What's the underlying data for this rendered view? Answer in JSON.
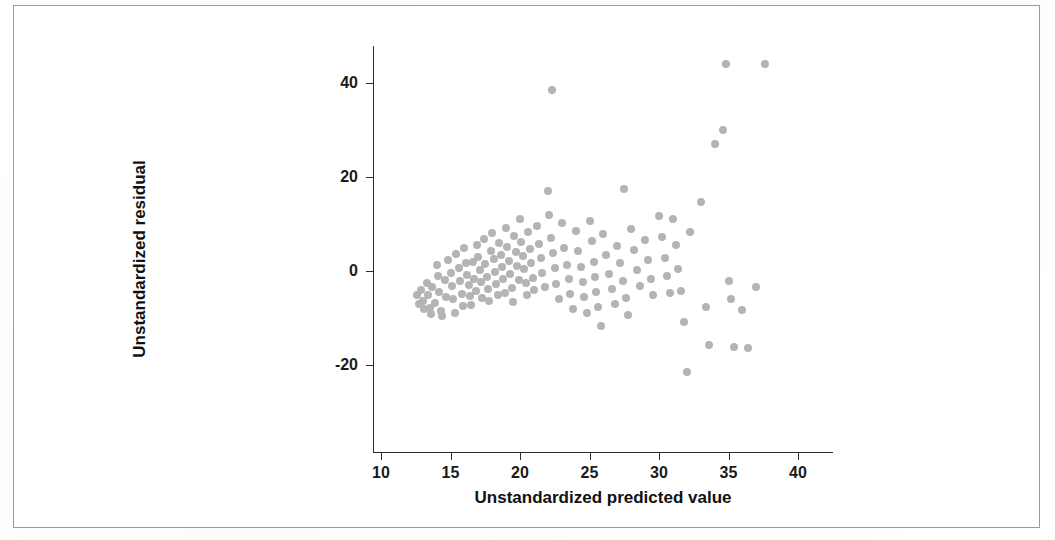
{
  "figure": {
    "background_color": "#ffffff",
    "border_color": "#9a9a9a",
    "axis_color": "#2b2b2b",
    "marker_color": "#b4b4b4"
  },
  "chart_data": {
    "type": "scatter",
    "title": "",
    "xlabel": "Unstandardized predicted value",
    "ylabel": "Unstandardized residual",
    "xlim": [
      8.5,
      41.5
    ],
    "ylim": [
      -28,
      48
    ],
    "xticks": [
      10,
      15,
      20,
      25,
      30,
      35,
      40
    ],
    "xticklabels": [
      "10",
      "15",
      "20",
      "25",
      "30",
      "35",
      "40"
    ],
    "yticks": [
      40,
      20,
      0,
      -20
    ],
    "yticklabels": [
      "40",
      "20",
      "0",
      "-20"
    ],
    "grid": false,
    "legend": false,
    "marker": "circle",
    "marker_color": "#b4b4b4",
    "points": [
      [
        12.6,
        -5.2
      ],
      [
        12.7,
        -7.0
      ],
      [
        12.9,
        -4.0
      ],
      [
        13.0,
        -6.3
      ],
      [
        13.1,
        -8.0
      ],
      [
        13.3,
        -2.6
      ],
      [
        13.4,
        -5.0
      ],
      [
        13.5,
        -7.8
      ],
      [
        13.6,
        -9.2
      ],
      [
        13.7,
        -3.4
      ],
      [
        13.9,
        -6.8
      ],
      [
        14.0,
        1.2
      ],
      [
        14.1,
        -1.0
      ],
      [
        14.2,
        -4.5
      ],
      [
        14.3,
        -8.6
      ],
      [
        14.4,
        -9.6
      ],
      [
        14.6,
        -2.0
      ],
      [
        14.7,
        -5.6
      ],
      [
        14.8,
        2.4
      ],
      [
        15.0,
        -0.4
      ],
      [
        15.1,
        -3.2
      ],
      [
        15.2,
        -6.0
      ],
      [
        15.3,
        -9.0
      ],
      [
        15.4,
        3.6
      ],
      [
        15.6,
        0.6
      ],
      [
        15.7,
        -2.2
      ],
      [
        15.8,
        -4.8
      ],
      [
        15.9,
        -7.4
      ],
      [
        16.0,
        4.8
      ],
      [
        16.1,
        1.8
      ],
      [
        16.2,
        -0.8
      ],
      [
        16.3,
        -3.0
      ],
      [
        16.4,
        -5.4
      ],
      [
        16.5,
        -7.2
      ],
      [
        16.6,
        2.0
      ],
      [
        16.7,
        -1.6
      ],
      [
        16.8,
        -4.2
      ],
      [
        16.9,
        5.6
      ],
      [
        17.0,
        3.0
      ],
      [
        17.1,
        0.2
      ],
      [
        17.2,
        -2.4
      ],
      [
        17.3,
        -5.8
      ],
      [
        17.4,
        6.8
      ],
      [
        17.5,
        1.4
      ],
      [
        17.6,
        -1.2
      ],
      [
        17.7,
        -3.8
      ],
      [
        17.8,
        -6.4
      ],
      [
        17.9,
        4.2
      ],
      [
        18.0,
        8.0
      ],
      [
        18.1,
        2.6
      ],
      [
        18.2,
        -0.2
      ],
      [
        18.3,
        -2.8
      ],
      [
        18.4,
        -5.0
      ],
      [
        18.5,
        6.0
      ],
      [
        18.6,
        3.4
      ],
      [
        18.7,
        0.8
      ],
      [
        18.8,
        -1.8
      ],
      [
        18.9,
        -4.6
      ],
      [
        19.0,
        9.2
      ],
      [
        19.1,
        5.2
      ],
      [
        19.2,
        2.2
      ],
      [
        19.3,
        -0.6
      ],
      [
        19.4,
        -3.6
      ],
      [
        19.5,
        -6.6
      ],
      [
        19.6,
        7.4
      ],
      [
        19.7,
        4.0
      ],
      [
        19.8,
        1.0
      ],
      [
        19.9,
        -2.0
      ],
      [
        20.0,
        11.0
      ],
      [
        20.1,
        6.2
      ],
      [
        20.2,
        3.2
      ],
      [
        20.3,
        0.4
      ],
      [
        20.4,
        -2.6
      ],
      [
        20.5,
        -5.2
      ],
      [
        20.6,
        8.4
      ],
      [
        20.7,
        4.6
      ],
      [
        20.8,
        1.6
      ],
      [
        20.9,
        -1.4
      ],
      [
        21.0,
        -4.0
      ],
      [
        21.2,
        9.6
      ],
      [
        21.4,
        5.8
      ],
      [
        21.5,
        2.8
      ],
      [
        21.6,
        -0.4
      ],
      [
        21.8,
        -3.4
      ],
      [
        22.0,
        17.0
      ],
      [
        22.1,
        12.0
      ],
      [
        22.2,
        7.0
      ],
      [
        22.3,
        38.5
      ],
      [
        22.4,
        3.8
      ],
      [
        22.5,
        0.6
      ],
      [
        22.6,
        -2.8
      ],
      [
        22.8,
        -6.0
      ],
      [
        23.0,
        10.2
      ],
      [
        23.2,
        5.0
      ],
      [
        23.4,
        1.2
      ],
      [
        23.5,
        -1.8
      ],
      [
        23.6,
        -4.8
      ],
      [
        23.8,
        -8.0
      ],
      [
        24.0,
        8.6
      ],
      [
        24.2,
        4.2
      ],
      [
        24.4,
        0.8
      ],
      [
        24.5,
        -2.4
      ],
      [
        24.6,
        -5.6
      ],
      [
        24.8,
        -9.0
      ],
      [
        25.0,
        10.6
      ],
      [
        25.2,
        6.4
      ],
      [
        25.3,
        2.0
      ],
      [
        25.4,
        -1.2
      ],
      [
        25.5,
        -4.4
      ],
      [
        25.6,
        -7.6
      ],
      [
        25.8,
        -11.6
      ],
      [
        26.0,
        7.8
      ],
      [
        26.2,
        3.4
      ],
      [
        26.4,
        -0.6
      ],
      [
        26.6,
        -3.8
      ],
      [
        26.8,
        -7.0
      ],
      [
        27.0,
        5.4
      ],
      [
        27.2,
        1.6
      ],
      [
        27.4,
        -2.2
      ],
      [
        27.5,
        17.4
      ],
      [
        27.6,
        -5.8
      ],
      [
        27.8,
        -9.4
      ],
      [
        28.0,
        9.0
      ],
      [
        28.2,
        4.4
      ],
      [
        28.4,
        0.2
      ],
      [
        28.6,
        -3.2
      ],
      [
        29.0,
        6.6
      ],
      [
        29.2,
        2.4
      ],
      [
        29.4,
        -1.6
      ],
      [
        29.6,
        -5.0
      ],
      [
        30.0,
        11.8
      ],
      [
        30.2,
        7.2
      ],
      [
        30.4,
        2.8
      ],
      [
        30.6,
        -1.0
      ],
      [
        30.8,
        -4.6
      ],
      [
        31.0,
        11.0
      ],
      [
        31.2,
        5.6
      ],
      [
        31.4,
        0.4
      ],
      [
        31.6,
        -4.2
      ],
      [
        31.8,
        -10.8
      ],
      [
        32.0,
        -21.4
      ],
      [
        32.2,
        8.2
      ],
      [
        33.0,
        14.6
      ],
      [
        33.4,
        -7.6
      ],
      [
        33.6,
        -15.8
      ],
      [
        34.0,
        27.0
      ],
      [
        34.6,
        30.0
      ],
      [
        34.8,
        44.0
      ],
      [
        35.0,
        -2.2
      ],
      [
        35.2,
        -6.0
      ],
      [
        35.4,
        -16.2
      ],
      [
        36.0,
        -8.2
      ],
      [
        36.4,
        -16.4
      ],
      [
        37.0,
        -3.4
      ],
      [
        37.6,
        44.0
      ]
    ]
  }
}
